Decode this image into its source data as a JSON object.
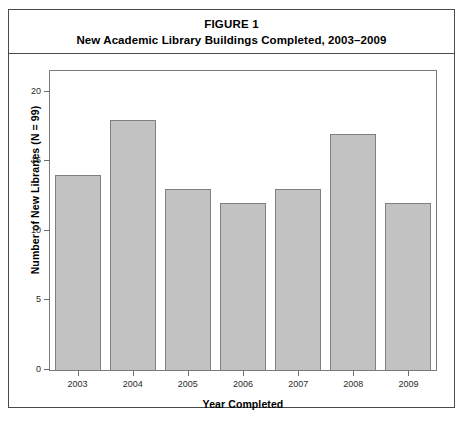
{
  "figure": {
    "number_label": "FIGURE 1",
    "title": "New Academic Library Buildings Completed, 2003–2009"
  },
  "chart_data": {
    "type": "bar",
    "title": "New Academic Library Buildings Completed, 2003–2009",
    "categories": [
      "2003",
      "2004",
      "2005",
      "2006",
      "2007",
      "2008",
      "2009"
    ],
    "values": [
      14,
      18,
      13,
      12,
      13,
      17,
      12
    ],
    "xlabel": "Year Completed",
    "ylabel": "Number of New Libraries (N = 99)",
    "ylim": [
      0,
      21.5
    ],
    "yticks": [
      0,
      5,
      10,
      15,
      20
    ],
    "ytick_labels": [
      "0",
      "5",
      "10",
      "15",
      "20"
    ],
    "grid": false,
    "legend": false,
    "bar_fill_color": "#c2c2c2",
    "bar_border_color": "#808080",
    "axis_color": "#7a7a7a",
    "total_n": 99
  }
}
